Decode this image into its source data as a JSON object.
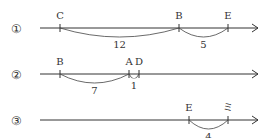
{
  "lines": [
    {
      "label": "①",
      "points": [
        {
          "name": "C",
          "x": 60
        },
        {
          "name": "B",
          "x": 179
        },
        {
          "name": "E",
          "x": 228
        }
      ],
      "arcs": [
        {
          "from": 60,
          "to": 179,
          "value": "12"
        },
        {
          "from": 179,
          "to": 228,
          "value": "5"
        }
      ]
    },
    {
      "label": "②",
      "points": [
        {
          "name": "B",
          "x": 60
        },
        {
          "name": "A",
          "x": 129
        },
        {
          "name": "D",
          "x": 139
        }
      ],
      "arcs": [
        {
          "from": 60,
          "to": 129,
          "value": "7"
        },
        {
          "from": 129,
          "to": 139,
          "value": "1"
        }
      ]
    },
    {
      "label": "③",
      "points": [
        {
          "name": "E",
          "x": 189
        },
        {
          "name": "ミ",
          "x": 228
        }
      ],
      "arcs": [
        {
          "from": 189,
          "to": 228,
          "value": "4"
        }
      ]
    }
  ]
}
